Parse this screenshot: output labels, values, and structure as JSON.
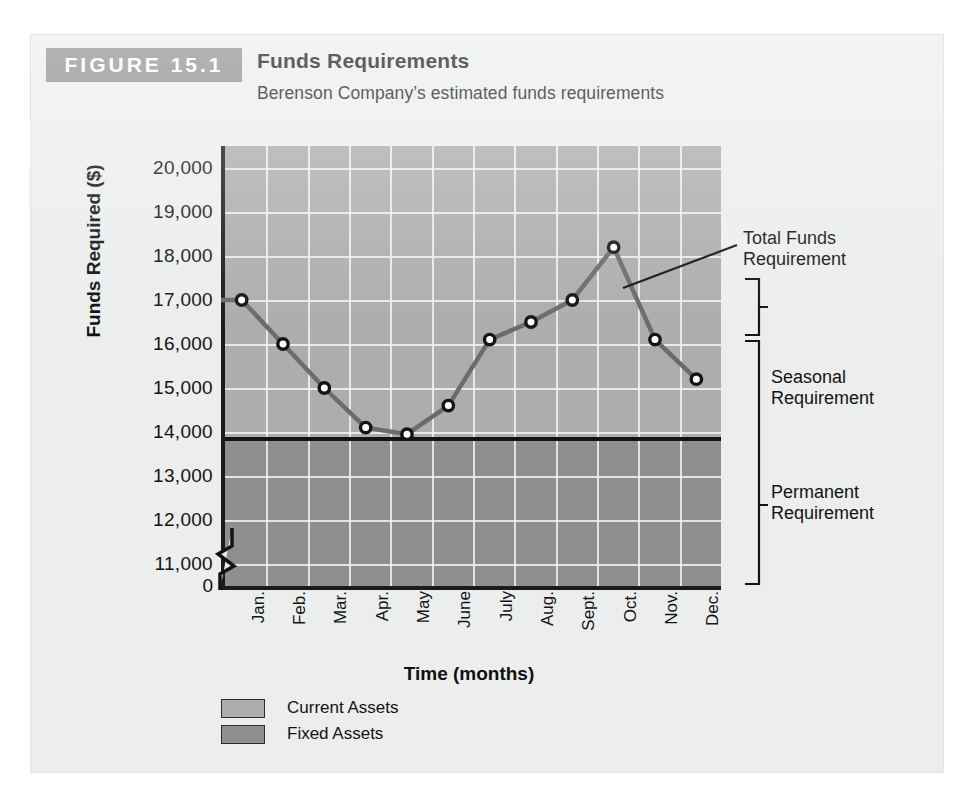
{
  "figure": {
    "badge_label": "FIGURE 15.1",
    "title": "Funds Requirements",
    "subtitle": "Berenson Company’s estimated funds requirements"
  },
  "annotations": {
    "total": "Total Funds\nRequirement",
    "total_line1": "Total Funds",
    "total_line2": "Requirement",
    "seasonal_line1": "Seasonal",
    "seasonal_line2": "Requirement",
    "permanent_line1": "Permanent",
    "permanent_line2": "Requirement"
  },
  "legend": {
    "items": [
      {
        "label": "Current Assets",
        "color": "#adadad"
      },
      {
        "label": "Fixed Assets",
        "color": "#8f8f8f"
      }
    ]
  },
  "colors": {
    "badge": "#8d8d8d",
    "card_background": "#eceded",
    "plot_current_assets": "#adadad",
    "plot_fixed_assets": "#8f8f8f",
    "axis": "#131313",
    "gridline": "#f2f2f2",
    "series_line": "#6b6b6b",
    "marker_stroke": "#141414",
    "marker_fill": "#ffffff"
  },
  "chart_data": {
    "type": "line",
    "title": "Funds Requirements",
    "subtitle": "Berenson Company’s estimated funds requirements",
    "xlabel": "Time (months)",
    "ylabel": "Funds Required ($)",
    "categories": [
      "Jan.",
      "Feb.",
      "Mar.",
      "Apr.",
      "May",
      "June",
      "July",
      "Aug.",
      "Sept.",
      "Oct.",
      "Nov.",
      "Dec."
    ],
    "series": [
      {
        "name": "Total Funds Requirement",
        "values": [
          17000,
          16000,
          15000,
          14100,
          13950,
          14600,
          16100,
          16500,
          17000,
          18200,
          16100,
          15200
        ]
      }
    ],
    "ylim": [
      10500,
      20500
    ],
    "ytick_labels": [
      "20,000",
      "19,000",
      "18,000",
      "17,000",
      "16,000",
      "15,000",
      "14,000",
      "13,000",
      "12,000",
      "11,000"
    ],
    "ytick_values": [
      20000,
      19000,
      18000,
      17000,
      16000,
      15000,
      14000,
      13000,
      12000,
      11000
    ],
    "zero_label": "0",
    "axis_break": true,
    "grid": true,
    "legend_position": "below-left",
    "reference_line": {
      "label": "Permanent Requirement level",
      "value": 13850
    },
    "bands": [
      {
        "name": "Current Assets",
        "from": 13850,
        "to": 20500
      },
      {
        "name": "Fixed Assets",
        "from": 10500,
        "to": 13850
      }
    ]
  }
}
